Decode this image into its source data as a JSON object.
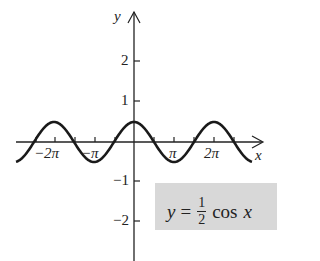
{
  "chart_data": {
    "type": "line",
    "title": "",
    "equation": {
      "lhs": "y",
      "equals": "=",
      "numerator": "1",
      "denominator": "2",
      "func": "cos",
      "var": "x"
    },
    "xlabel": "x",
    "ylabel": "y",
    "x_ticks": [
      "−2π",
      "−π",
      "π",
      "2π"
    ],
    "y_ticks": [
      "2",
      "1",
      "−1",
      "−2"
    ],
    "xlim": [
      -2.95,
      3.0
    ],
    "xlim_units": "π",
    "ylim": [
      -3,
      3.2
    ],
    "series": [
      {
        "name": "y = 1/2 cos x",
        "amplitude": 0.5,
        "period": "2π",
        "x": [
          "-2.95π",
          "-2π",
          "-1.5π",
          "-π",
          "-0.5π",
          "0",
          "0.5π",
          "π",
          "1.5π",
          "2π",
          "2.95π"
        ],
        "values": [
          -0.49,
          0.5,
          0,
          -0.5,
          0,
          0.5,
          0,
          -0.5,
          0,
          0.5,
          -0.49
        ]
      }
    ],
    "grid": false,
    "legend": "none",
    "colors": {
      "curve": "#1a1a1a",
      "axis": "#222222",
      "label_box": "#d8d8d8"
    }
  }
}
